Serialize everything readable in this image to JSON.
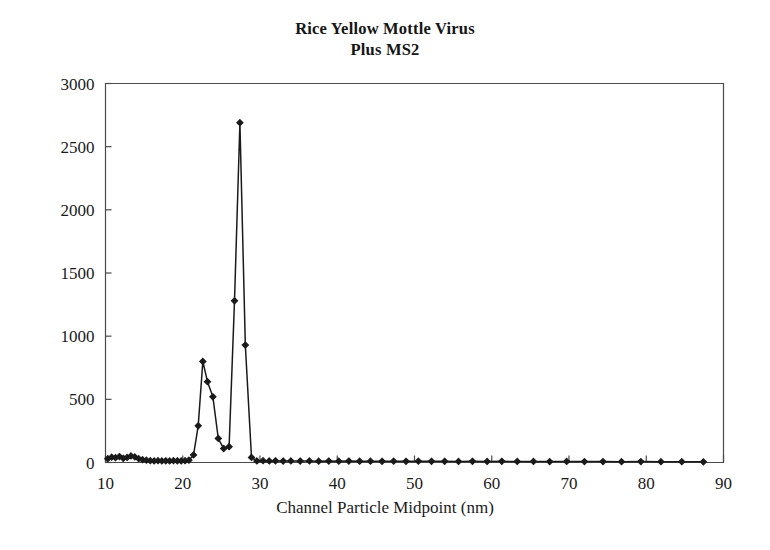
{
  "chart_data": {
    "type": "line",
    "title": "Rice Yellow Mottle Virus Plus MS2",
    "title_lines": [
      "Rice Yellow Mottle Virus",
      "Plus MS2"
    ],
    "xlabel": "Channel Particle Midpoint (nm)",
    "ylabel": "",
    "xlim": [
      10,
      90
    ],
    "ylim": [
      0,
      3000
    ],
    "xticks": [
      10,
      20,
      30,
      40,
      50,
      60,
      70,
      80,
      90
    ],
    "yticks": [
      0,
      500,
      1000,
      1500,
      2000,
      2500,
      3000
    ],
    "xtick_labels": [
      "10",
      "20",
      "30",
      "40",
      "50",
      "60",
      "70",
      "80",
      "90"
    ],
    "ytick_labels": [
      "0",
      "500",
      "1000",
      "1500",
      "2000",
      "2500",
      "3000"
    ],
    "grid": false,
    "legend": false,
    "marker": "filled-diamond",
    "line_color": "#1a1a1a",
    "series": [
      {
        "name": "Rice Yellow Mottle Virus Plus MS2",
        "x": [
          10.3,
          10.8,
          11.3,
          11.8,
          12.3,
          12.8,
          13.3,
          13.8,
          14.3,
          14.8,
          15.3,
          15.8,
          16.3,
          16.8,
          17.3,
          17.8,
          18.3,
          18.8,
          19.3,
          19.8,
          20.3,
          20.8,
          21.4,
          22.0,
          22.6,
          23.2,
          23.9,
          24.6,
          25.3,
          26.0,
          26.7,
          27.4,
          28.1,
          28.9,
          29.6,
          30.4,
          31.2,
          32.0,
          33.0,
          34.0,
          35.2,
          36.4,
          37.6,
          38.9,
          40.2,
          41.5,
          42.9,
          44.3,
          45.8,
          47.3,
          48.9,
          50.5,
          52.2,
          53.9,
          55.7,
          57.5,
          59.4,
          61.3,
          63.3,
          65.4,
          67.5,
          69.7,
          72.0,
          74.4,
          76.8,
          79.3,
          81.9,
          84.6,
          87.4
        ],
        "y": [
          30,
          42,
          38,
          47,
          33,
          40,
          52,
          44,
          30,
          22,
          18,
          14,
          12,
          14,
          12,
          13,
          12,
          14,
          13,
          12,
          14,
          18,
          60,
          290,
          800,
          640,
          520,
          190,
          110,
          125,
          1280,
          2690,
          930,
          40,
          12,
          14,
          12,
          13,
          11,
          12,
          11,
          12,
          10,
          11,
          10,
          11,
          10,
          10,
          9,
          10,
          9,
          10,
          9,
          9,
          8,
          9,
          8,
          9,
          8,
          8,
          7,
          8,
          7,
          7,
          6,
          7,
          6,
          6,
          5
        ]
      }
    ]
  },
  "axes": {
    "x_title": "Channel Particle Midpoint (nm)"
  }
}
